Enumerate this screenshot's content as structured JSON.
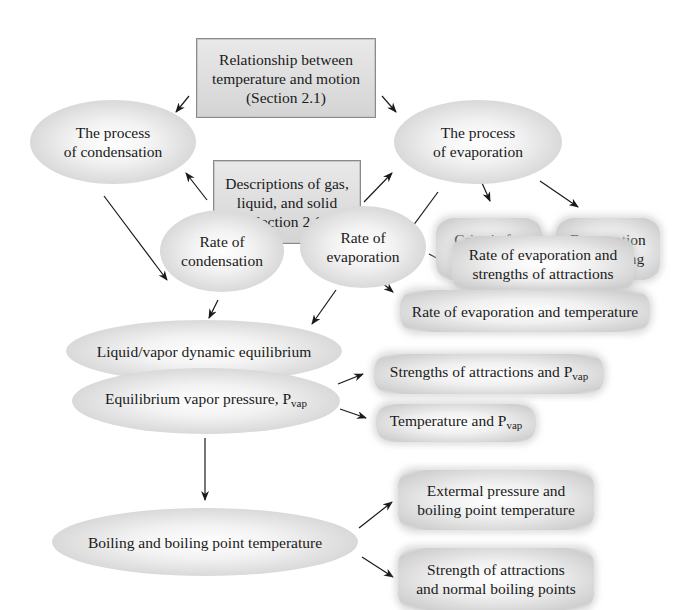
{
  "diagram": {
    "nodes": {
      "relationship": "Relationship between\ntemperature and motion\n(Section 2.1)",
      "descriptions": "Descriptions of gas,\nliquid, and solid\n(Section 2.1)",
      "process_condensation": "The process\nof condensation",
      "process_evaporation": "The process\nof evaporation",
      "criteria_evaporation": "Criteria for\nevaporation",
      "evaporation_cooling": "Evaporation\nand cooling",
      "rate_condensation": "Rate of\ncondensation",
      "rate_evaporation": "Rate of\nevaporation",
      "rate_evap_attractions": "Rate of evaporation and\nstrengths of attractions",
      "rate_evap_temperature": "Rate of evaporation and temperature",
      "dynamic_equilibrium": "Liquid/vapor dynamic equilibrium",
      "equilibrium_vapor_pressure": "Equilibrium vapor pressure, P",
      "strengths_pvap": "Strengths of attractions and P",
      "temperature_pvap": "Temperature and P",
      "boiling": "Boiling and boiling point temperature",
      "external_pressure": "Extermal pressure and\nboiling point temperature",
      "strength_normal_bp": "Strength of attractions\nand normal boiling points",
      "pvap_subscript": "vap"
    },
    "edges": [
      [
        "relationship",
        "process_condensation"
      ],
      [
        "relationship",
        "process_evaporation"
      ],
      [
        "descriptions",
        "process_condensation"
      ],
      [
        "descriptions",
        "process_evaporation"
      ],
      [
        "process_condensation",
        "rate_condensation"
      ],
      [
        "process_evaporation",
        "rate_evaporation"
      ],
      [
        "process_evaporation",
        "criteria_evaporation"
      ],
      [
        "process_evaporation",
        "evaporation_cooling"
      ],
      [
        "rate_evaporation",
        "rate_evap_attractions"
      ],
      [
        "rate_evaporation",
        "rate_evap_temperature"
      ],
      [
        "rate_condensation",
        "dynamic_equilibrium"
      ],
      [
        "rate_evaporation",
        "dynamic_equilibrium"
      ],
      [
        "dynamic_equilibrium",
        "equilibrium_vapor_pressure"
      ],
      [
        "equilibrium_vapor_pressure",
        "strengths_pvap"
      ],
      [
        "equilibrium_vapor_pressure",
        "temperature_pvap"
      ],
      [
        "equilibrium_vapor_pressure",
        "boiling"
      ],
      [
        "boiling",
        "external_pressure"
      ],
      [
        "boiling",
        "strength_normal_bp"
      ]
    ],
    "colors": {
      "box_fill": "#dcdcdc",
      "box_border": "#8a8a8a",
      "arrow": "#1a1a1a"
    }
  }
}
